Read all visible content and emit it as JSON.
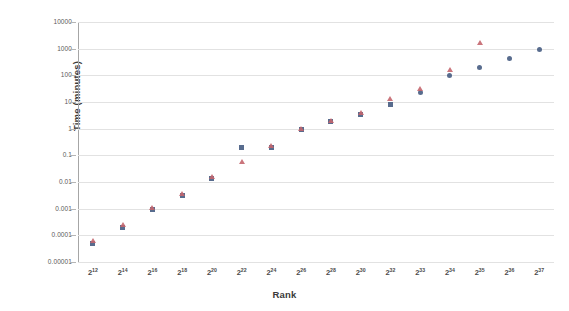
{
  "chart_data": {
    "type": "scatter",
    "title": "",
    "xlabel": "Rank",
    "ylabel": "Time (minutes)",
    "yscale": "log",
    "ylim": [
      1e-05,
      10000
    ],
    "grid": true,
    "legend": "none",
    "y_ticks": [
      "10000",
      "1000",
      "100",
      "10",
      "1",
      "0.1",
      "0.01",
      "0.001",
      "0.0001",
      "0.00001"
    ],
    "y_tick_values": [
      10000,
      1000,
      100,
      10,
      1,
      0.1,
      0.01,
      0.001,
      0.0001,
      1e-05
    ],
    "x_tick_bases": [
      "2",
      "2",
      "2",
      "2",
      "2",
      "2",
      "2",
      "2",
      "2",
      "2",
      "2",
      "2",
      "2",
      "2",
      "2",
      "2"
    ],
    "x_tick_exponents": [
      "12",
      "14",
      "16",
      "18",
      "20",
      "22",
      "24",
      "26",
      "28",
      "30",
      "32",
      "33",
      "34",
      "35",
      "36",
      "37"
    ],
    "x_tick_labels": [
      "2^12",
      "2^14",
      "2^16",
      "2^18",
      "2^20",
      "2^22",
      "2^24",
      "2^26",
      "2^28",
      "2^30",
      "2^32",
      "2^33",
      "2^34",
      "2^35",
      "2^36",
      "2^37"
    ],
    "series": [
      {
        "name": "series-squares",
        "marker": "square",
        "color": "#4a5f84",
        "points": [
          {
            "x_label": "2^12",
            "y": 5e-05
          },
          {
            "x_label": "2^14",
            "y": 0.0002
          },
          {
            "x_label": "2^16",
            "y": 0.0009
          },
          {
            "x_label": "2^18",
            "y": 0.003
          },
          {
            "x_label": "2^20",
            "y": 0.013
          },
          {
            "x_label": "2^22",
            "y": 0.2
          },
          {
            "x_label": "2^24",
            "y": 0.2
          },
          {
            "x_label": "2^26",
            "y": 0.9
          },
          {
            "x_label": "2^28",
            "y": 1.8
          },
          {
            "x_label": "2^30",
            "y": 3.5
          },
          {
            "x_label": "2^32",
            "y": 8
          },
          {
            "x_label": "2^33",
            "y": 22
          },
          {
            "x_label": "2^34",
            "y": 100
          },
          {
            "x_label": "2^35",
            "y": 200
          },
          {
            "x_label": "2^36",
            "y": 420
          },
          {
            "x_label": "2^37",
            "y": 900
          }
        ]
      },
      {
        "name": "series-triangles",
        "marker": "triangle",
        "color": "#c4666e",
        "points": [
          {
            "x_label": "2^12",
            "y": 6e-05
          },
          {
            "x_label": "2^14",
            "y": 0.00025
          },
          {
            "x_label": "2^16",
            "y": 0.0011
          },
          {
            "x_label": "2^18",
            "y": 0.0035
          },
          {
            "x_label": "2^20",
            "y": 0.016
          },
          {
            "x_label": "2^22",
            "y": 0.055
          },
          {
            "x_label": "2^24",
            "y": 0.22
          },
          {
            "x_label": "2^26",
            "y": 1.0
          },
          {
            "x_label": "2^28",
            "y": 2.0
          },
          {
            "x_label": "2^30",
            "y": 4.0
          },
          {
            "x_label": "2^32",
            "y": 13
          },
          {
            "x_label": "2^33",
            "y": 30
          },
          {
            "x_label": "2^34",
            "y": 160
          },
          {
            "x_label": "2^35",
            "y": 1700
          }
        ]
      }
    ]
  }
}
